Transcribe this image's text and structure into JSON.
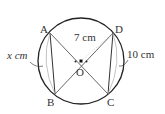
{
  "diagram": {
    "points": {
      "A": "A",
      "B": "B",
      "C": "C",
      "D": "D",
      "O": "O"
    },
    "labels": {
      "radius": "7 cm",
      "left_chord": "x cm",
      "right_chord": "10 cm"
    }
  }
}
